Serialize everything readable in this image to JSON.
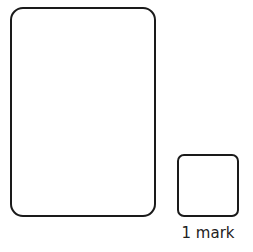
{
  "answer_area": {
    "working_box": {
      "label": ""
    },
    "answer_box": {
      "label": ""
    },
    "marks_label": "1 mark"
  },
  "colors": {
    "border": "#1a1a1a",
    "background": "#ffffff"
  }
}
